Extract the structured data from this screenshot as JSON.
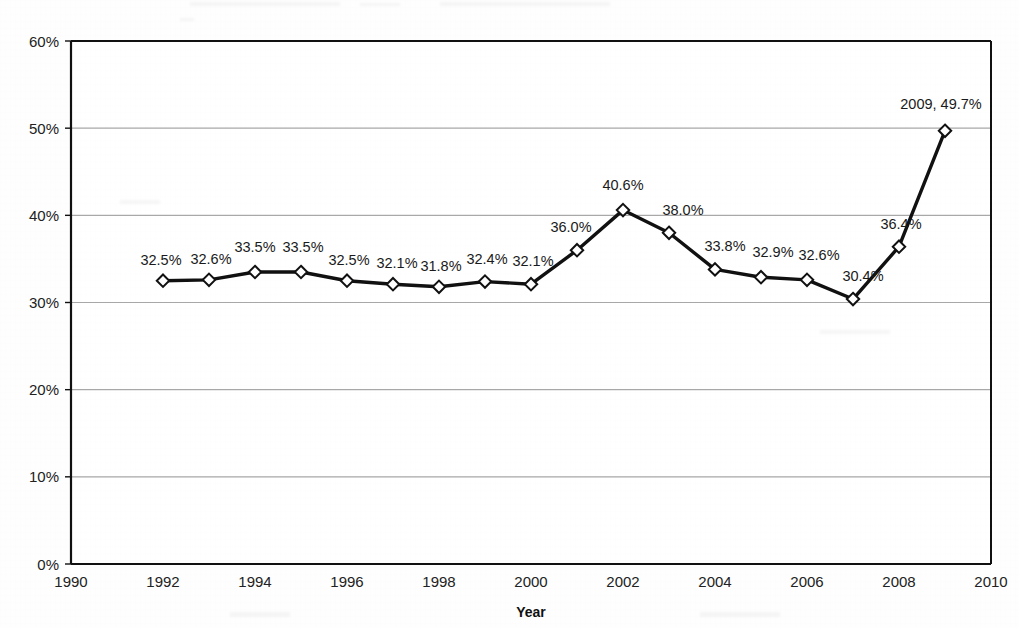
{
  "chart_data": {
    "type": "line",
    "title": "",
    "xlabel": "Year",
    "ylabel": "",
    "xlim": [
      1990,
      2010
    ],
    "ylim": [
      0,
      60
    ],
    "grid": true,
    "legend": "none",
    "marker": "diamond-open",
    "x": [
      1992,
      1993,
      1994,
      1995,
      1996,
      1997,
      1998,
      1999,
      2000,
      2001,
      2002,
      2003,
      2004,
      2005,
      2006,
      2007,
      2008,
      2009
    ],
    "values": [
      32.5,
      32.6,
      33.5,
      33.5,
      32.5,
      32.1,
      31.8,
      32.4,
      32.1,
      36.0,
      40.6,
      38.0,
      33.8,
      32.9,
      32.6,
      30.4,
      36.4,
      49.7
    ],
    "point_labels": [
      "32.5%",
      "32.6%",
      "33.5%",
      "33.5%",
      "32.5%",
      "32.1%",
      "31.8%",
      "32.4%",
      "32.1%",
      "36.0%",
      "40.6%",
      "38.0%",
      "33.8%",
      "32.9%",
      "32.6%",
      "30.4%",
      "36.4%",
      "2009, 49.7%"
    ],
    "xticks": [
      1990,
      1992,
      1994,
      1996,
      1998,
      2000,
      2002,
      2004,
      2006,
      2008,
      2010
    ],
    "xtick_labels": [
      "1990",
      "1992",
      "1994",
      "1996",
      "1998",
      "2000",
      "2002",
      "2004",
      "2006",
      "2008",
      "2010"
    ],
    "yticks": [
      0,
      10,
      20,
      30,
      40,
      50,
      60
    ],
    "ytick_labels": [
      "0%",
      "10%",
      "20%",
      "30%",
      "40%",
      "50%",
      "60%"
    ],
    "colors": {
      "line": "#111111",
      "marker_fill": "#ffffff",
      "marker_stroke": "#111111",
      "grid": "#9a9a9a",
      "axis": "#111111",
      "text": "#1a1a1a",
      "background": "#fefefe"
    }
  }
}
